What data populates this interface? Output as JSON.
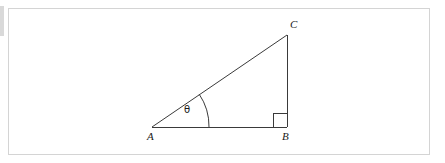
{
  "canvas": {
    "width": 445,
    "height": 163,
    "background_color": "#ffffff"
  },
  "frame": {
    "border_color": "#d4d4d4",
    "x": 8,
    "y": 8,
    "width": 422,
    "height": 147
  },
  "figure": {
    "kind": "right-triangle",
    "stroke_color": "#333333",
    "stroke_width": 1,
    "vertices": {
      "A": {
        "x": 152,
        "y": 127,
        "label": "A"
      },
      "B": {
        "x": 287,
        "y": 127,
        "label": "B"
      },
      "C": {
        "x": 287,
        "y": 35,
        "label": "C"
      }
    },
    "sides": [
      {
        "name": "base-AB",
        "from": "A",
        "to": "B"
      },
      {
        "name": "vertical-BC",
        "from": "B",
        "to": "C"
      },
      {
        "name": "hypotenuse-AC",
        "from": "A",
        "to": "C"
      }
    ],
    "angle_marker": {
      "name": "theta",
      "label": "θ",
      "at_vertex": "A",
      "radius": 57,
      "label_x": 188,
      "label_y": 112
    },
    "right_angle_marker": {
      "name": "right-angle-square",
      "at_vertex": "B",
      "size": 14
    }
  }
}
